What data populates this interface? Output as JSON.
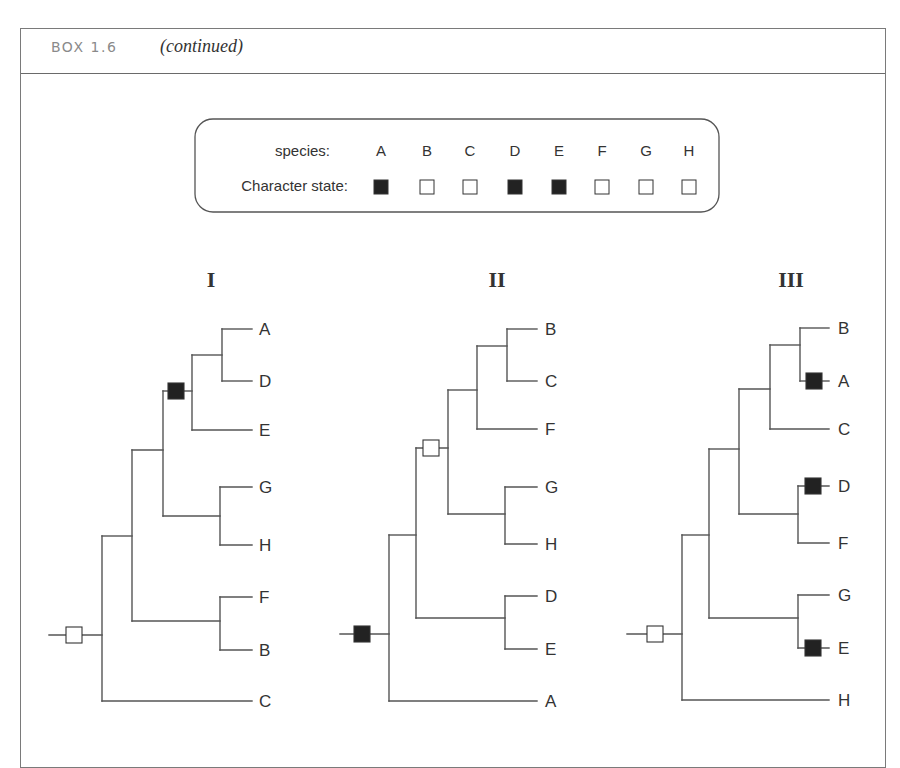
{
  "header": {
    "label": "BOX 1.6",
    "subtitle": "(continued)"
  },
  "legend": {
    "species_label": "species:",
    "state_label": "Character state:",
    "species": [
      "A",
      "B",
      "C",
      "D",
      "E",
      "F",
      "G",
      "H"
    ],
    "states": [
      "derived",
      "ancestral",
      "ancestral",
      "derived",
      "derived",
      "ancestral",
      "ancestral",
      "ancestral"
    ]
  },
  "colors": {
    "derived": "#222222",
    "ancestral": "#ffffff",
    "line": "#555555"
  },
  "trees": [
    {
      "title": "I",
      "newick": "(((((A,D),E),(G,H)),(F,B)),C)",
      "leaves": [
        "A",
        "D",
        "E",
        "G",
        "H",
        "F",
        "B",
        "C"
      ],
      "markers": [
        {
          "position": "root",
          "state": "ancestral"
        },
        {
          "position": "stem of (A,D,E)",
          "state": "derived"
        }
      ]
    },
    {
      "title": "II",
      "newick": "(((((B,C),F),(G,H)),(D,E)),A)",
      "leaves": [
        "B",
        "C",
        "F",
        "G",
        "H",
        "D",
        "E",
        "A"
      ],
      "markers": [
        {
          "position": "root",
          "state": "derived"
        },
        {
          "position": "stem of (B,C,F,G,H)",
          "state": "ancestral"
        }
      ]
    },
    {
      "title": "III",
      "newick": "(((((B,A),C),(D,F)),(G,E)),H)",
      "leaves": [
        "B",
        "A",
        "C",
        "D",
        "F",
        "G",
        "E",
        "H"
      ],
      "markers": [
        {
          "position": "root",
          "state": "ancestral"
        },
        {
          "position": "branch A",
          "state": "derived"
        },
        {
          "position": "branch D",
          "state": "derived"
        },
        {
          "position": "branch E",
          "state": "derived"
        }
      ]
    }
  ]
}
